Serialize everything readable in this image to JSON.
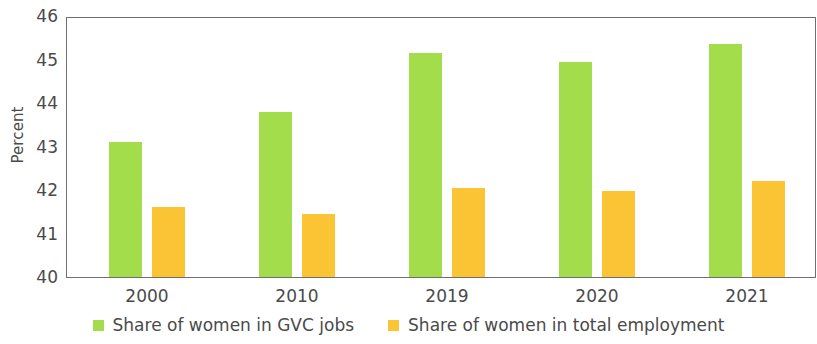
{
  "chart_data": {
    "type": "bar",
    "title": "",
    "xlabel": "",
    "ylabel": "Percent",
    "ylim": [
      40,
      46
    ],
    "yticks": [
      40,
      41,
      42,
      43,
      44,
      45,
      46
    ],
    "grid": false,
    "legend_position": "bottom-center",
    "categories": [
      "2000",
      "2010",
      "2019",
      "2020",
      "2021"
    ],
    "series": [
      {
        "name": "Share of women in GVC jobs",
        "color": "#a3dd4b",
        "values": [
          43.1,
          43.8,
          45.15,
          44.95,
          45.35
        ]
      },
      {
        "name": "Share of women in total employment",
        "color": "#fac434",
        "values": [
          41.6,
          41.45,
          42.05,
          41.98,
          42.2
        ]
      }
    ]
  }
}
